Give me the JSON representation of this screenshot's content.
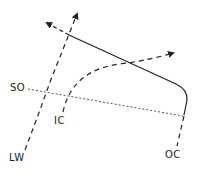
{
  "diagram": {
    "labels": {
      "so": "SO",
      "lw": "LW",
      "ic": "IC",
      "oc": "OC"
    },
    "colors": {
      "stroke": "#222222",
      "background": "#ffffff"
    },
    "elements": [
      {
        "id": "lw-line",
        "style": "dashed",
        "arrow": "end",
        "label": "LW"
      },
      {
        "id": "so-line",
        "style": "dotted",
        "arrow": "none",
        "label": "SO"
      },
      {
        "id": "solid-curve",
        "style": "solid",
        "arrow": "none"
      },
      {
        "id": "oc-line",
        "style": "dashed",
        "arrow": "none",
        "label": "OC"
      },
      {
        "id": "ic-curve",
        "style": "dashed",
        "arrow": "end",
        "label": "IC"
      },
      {
        "id": "upper-left-arrow",
        "style": "dashed",
        "arrow": "end"
      }
    ]
  }
}
